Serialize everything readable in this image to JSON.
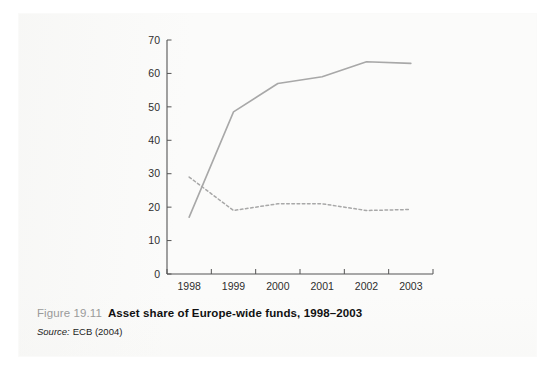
{
  "figure": {
    "number": "Figure 19.11",
    "title": "Asset share of Europe-wide funds, 1998–2003",
    "source_label": "Source:",
    "source_value": "ECB (2004)"
  },
  "colors": {
    "series_line": "#a8a8a8",
    "axis": "#555555",
    "tick_label": "#2e2e2e",
    "figure_number": "#9a9a9a",
    "title": "#111111",
    "page": "#fbfbfa"
  },
  "chart_data": {
    "type": "line",
    "title": "Asset share of Europe-wide funds, 1998–2003",
    "xlabel": "",
    "ylabel": "",
    "categories": [
      "1998",
      "1999",
      "2000",
      "2001",
      "2002",
      "2003"
    ],
    "x_tick_labels": [
      "1998",
      "1999",
      "2000",
      "2001",
      "2002",
      "2003"
    ],
    "y_tick_labels": [
      "0",
      "10",
      "20",
      "30",
      "40",
      "50",
      "60",
      "70"
    ],
    "y_ticks": [
      0,
      10,
      20,
      30,
      40,
      50,
      60,
      70
    ],
    "ylim": [
      0,
      70
    ],
    "grid": false,
    "legend": false,
    "legend_position": "none",
    "series": [
      {
        "name": "Europe-wide funds (solid)",
        "style": "solid",
        "color": "#a8a8a8",
        "values": [
          17,
          48.5,
          57,
          59,
          63.5,
          63
        ]
      },
      {
        "name": "Other funds (dashed)",
        "style": "dashed",
        "color": "#a8a8a8",
        "values": [
          29,
          19,
          21,
          21,
          19,
          19.3
        ]
      }
    ]
  }
}
